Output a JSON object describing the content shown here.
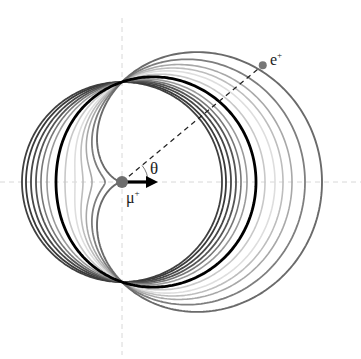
{
  "diagram": {
    "origin": {
      "x": 122,
      "y": 182
    },
    "scale_R": 100,
    "axes": {
      "color": "#d8d8d8",
      "dash": "5,4"
    },
    "curves": [
      {
        "a": 0.0,
        "color": "#404040",
        "width": 1.8
      },
      {
        "a": 0.04,
        "color": "#3a3a3a",
        "width": 1.8
      },
      {
        "a": 0.09,
        "color": "#474747",
        "width": 1.8
      },
      {
        "a": 0.14,
        "color": "#555555",
        "width": 1.8
      },
      {
        "a": 0.19,
        "color": "#777777",
        "width": 1.6
      },
      {
        "a": 0.25,
        "color": "#9a9a9a",
        "width": 1.6
      },
      {
        "a": 0.34,
        "color": "#000000",
        "width": 2.8
      },
      {
        "a": 0.43,
        "color": "#c8c8c8",
        "width": 1.6
      },
      {
        "a": 0.53,
        "color": "#dedede",
        "width": 1.6
      },
      {
        "a": 0.61,
        "color": "#bdbdbd",
        "width": 1.6
      },
      {
        "a": 0.7,
        "color": "#a8a8a8",
        "width": 1.6
      },
      {
        "a": 0.83,
        "color": "#7e7e7e",
        "width": 1.8
      },
      {
        "a": 1.0,
        "color": "#6a6a6a",
        "width": 1.9
      }
    ],
    "emission_angle_deg": 39.7,
    "muon": {
      "label": "μ",
      "charge": "+",
      "dot_color": "#6e6e6e",
      "arrow_color": "#000000"
    },
    "positron": {
      "label": "e",
      "charge": "+",
      "dot_color": "#777777"
    },
    "angle_label": "θ"
  }
}
